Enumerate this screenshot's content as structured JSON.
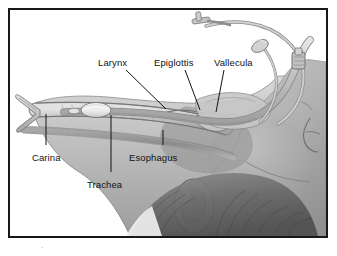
{
  "figure": {
    "style": "grayscale medical line-and-tone illustration",
    "frame": {
      "border_color": "#17181a",
      "background": "#ffffff"
    },
    "caption_mark": "·"
  },
  "palette": {
    "ink": "#111315",
    "frame": "#17181a",
    "paper": "#ffffff",
    "tissue_light": "#d7d7d7",
    "tissue_mid": "#b3b3b3",
    "tissue_dark": "#8d8d8d",
    "tissue_deep": "#6f6f6f",
    "hair_dark": "#4c4c4c",
    "tube_gray": "#bdbdbd",
    "tube_outline": "#7a7a7a",
    "cuff_white": "#f2f2f2",
    "airway_shadow": "#9a9a9a"
  },
  "labels": [
    {
      "id": "larynx",
      "text": "Larynx",
      "x": 96,
      "y": 55
    },
    {
      "id": "epiglottis",
      "text": "Epiglottis",
      "x": 152,
      "y": 55
    },
    {
      "id": "vallecula",
      "text": "Vallecula",
      "x": 212,
      "y": 55
    },
    {
      "id": "carina",
      "text": "Carina",
      "x": 30,
      "y": 150
    },
    {
      "id": "esophagus",
      "text": "Esophagus",
      "x": 127,
      "y": 150
    },
    {
      "id": "trachea",
      "text": "Trachea",
      "x": 85,
      "y": 177
    }
  ],
  "leader_lines": [
    {
      "id": "larynx-leader",
      "x1": 124,
      "y1": 68,
      "x2": 164,
      "y2": 107
    },
    {
      "id": "epiglottis-leader",
      "x1": 183,
      "y1": 68,
      "x2": 198,
      "y2": 108
    },
    {
      "id": "vallecula-leader",
      "x1": 222,
      "y1": 68,
      "x2": 214,
      "y2": 110
    },
    {
      "id": "carina-leader",
      "x1": 44,
      "y1": 112,
      "x2": 44,
      "y2": 143
    },
    {
      "id": "esophagus-leader",
      "x1": 161,
      "y1": 128,
      "x2": 161,
      "y2": 143
    },
    {
      "id": "trachea-leader",
      "x1": 109,
      "y1": 113,
      "x2": 109,
      "y2": 170
    }
  ],
  "anatomy_parts": [
    {
      "id": "trachea-lumen",
      "name": "trachea"
    },
    {
      "id": "carina-bifurcation",
      "name": "carina"
    },
    {
      "id": "esophagus-lumen",
      "name": "esophagus"
    },
    {
      "id": "larynx-region",
      "name": "larynx"
    },
    {
      "id": "epiglottis-flap",
      "name": "epiglottis"
    },
    {
      "id": "vallecula-pocket",
      "name": "vallecula"
    },
    {
      "id": "tongue-mass",
      "name": "tongue"
    },
    {
      "id": "head-profile",
      "name": "head and face profile"
    },
    {
      "id": "ear",
      "name": "ear"
    },
    {
      "id": "hair",
      "name": "hair"
    }
  ],
  "device": {
    "name": "endotracheal tube",
    "components": [
      {
        "id": "tube-shaft",
        "name": "endotracheal tube shaft"
      },
      {
        "id": "tube-cuff",
        "name": "inflated tracheal cuff"
      },
      {
        "id": "murphy-eye",
        "name": "murphy eye"
      },
      {
        "id": "pilot-line",
        "name": "cuff inflation line"
      },
      {
        "id": "pilot-balloon",
        "name": "pilot balloon"
      },
      {
        "id": "inflation-valve",
        "name": "inflation valve"
      },
      {
        "id": "tube-connector",
        "name": "15mm tube connector"
      }
    ]
  }
}
